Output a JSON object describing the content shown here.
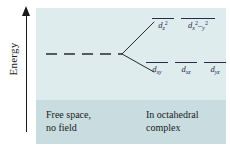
{
  "axis": {
    "label": "Energy",
    "arrow_direction": "up"
  },
  "diagram": {
    "type": "crystal-field-splitting",
    "free_ion_level": {
      "style": "dashed",
      "label": ""
    },
    "eg_set": {
      "orbitals": [
        {
          "base": "d",
          "sub": "z",
          "sup": "2"
        },
        {
          "base": "d",
          "sub": "x",
          "sup": "2",
          "tail": "–y",
          "tail_sup": "2"
        }
      ]
    },
    "t2g_set": {
      "orbitals": [
        {
          "base": "d",
          "sub": "xy"
        },
        {
          "base": "d",
          "sub": "xz"
        },
        {
          "base": "d",
          "sub": "yz"
        }
      ]
    }
  },
  "captions": {
    "left": {
      "line1": "Free space,",
      "line2": "no field"
    },
    "right": {
      "line1": "In octahedral",
      "line2": "complex"
    }
  },
  "colors": {
    "panel_upper": "#dfeced",
    "panel_lower": "#c9dcdf",
    "level_line": "#2a2a4a",
    "axis": "#1a1a1a",
    "text": "#1a1a1a"
  }
}
